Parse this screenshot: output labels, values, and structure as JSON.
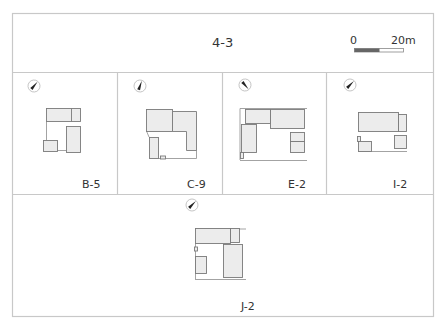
{
  "header": {
    "title": "4-3",
    "scale_bar": {
      "start_label": "0",
      "end_label": "20m",
      "dark_color": "#666666"
    }
  },
  "colors": {
    "frame": "#c8c8c8",
    "building_stroke": "#7a7a7a",
    "building_fill": "#ececec",
    "boundary_line": "#999999",
    "north_arrow": "#222222"
  },
  "panels": [
    {
      "id": "B-5",
      "label": "B-5",
      "north_rotation_deg": 40
    },
    {
      "id": "C-9",
      "label": "C-9",
      "north_rotation_deg": 20
    },
    {
      "id": "E-2",
      "label": "E-2",
      "north_rotation_deg": -40
    },
    {
      "id": "I-2",
      "label": "I-2",
      "north_rotation_deg": 45
    },
    {
      "id": "J-2",
      "label": "J-2",
      "north_rotation_deg": 45
    }
  ]
}
